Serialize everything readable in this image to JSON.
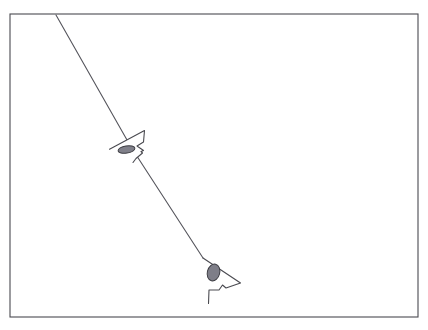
{
  "canvas": {
    "width": 428,
    "height": 330,
    "background_color": "#ffffff",
    "title": "Directional tracking diagram"
  },
  "frame": {
    "name": "border-rectangle",
    "x": 10,
    "y": 14,
    "width": 408,
    "height": 303,
    "stroke_color": "#4a4a50",
    "stroke_width": 1.1,
    "fill": "none"
  },
  "trajectory": {
    "name": "diagonal-path-line",
    "label": "trajectory line",
    "stroke_color": "#55555c",
    "stroke_width": 1.1,
    "points": [
      {
        "x": 56,
        "y": 15
      },
      {
        "x": 131,
        "y": 147
      },
      {
        "x": 203,
        "y": 258
      }
    ],
    "start_point": {
      "x": 56,
      "y": 15
    },
    "end_point": {
      "x": 203,
      "y": 258
    }
  },
  "markers": [
    {
      "id": "marker-upper",
      "name": "arrow-marker-upper",
      "label": "upper arrowhead marker",
      "orientation": "left-pointing",
      "stroke_color": "#4a4a50",
      "stroke_width": 1.1,
      "fill": "#ffffff",
      "outline_points": "109.5,149.2 144.5,130.5 143.5,142.0 137.0,146.0 143.5,150.5 141.0,151.5 142.5,153.0 136.0,158.5 133.0,162.5",
      "vertices": [
        {
          "x": 109.5,
          "y": 149.2
        },
        {
          "x": 144.5,
          "y": 130.5
        },
        {
          "x": 143.5,
          "y": 142.0
        },
        {
          "x": 137.0,
          "y": 146.0
        },
        {
          "x": 143.5,
          "y": 150.5
        },
        {
          "x": 141.0,
          "y": 151.5
        },
        {
          "x": 142.5,
          "y": 153.0
        },
        {
          "x": 136.0,
          "y": 158.5
        },
        {
          "x": 133.0,
          "y": 162.5
        }
      ],
      "ellipse": {
        "name": "marker-ellipse-upper",
        "cx": 126.5,
        "cy": 149.5,
        "rx": 8.5,
        "ry": 3.6,
        "rotation": -9,
        "fill_color": "#80808a",
        "stroke_color": "#3c3c42"
      }
    },
    {
      "id": "marker-lower",
      "name": "arrow-marker-lower",
      "label": "lower arrowhead marker",
      "orientation": "right-pointing",
      "stroke_color": "#4a4a50",
      "stroke_width": 1.1,
      "fill": "#ffffff",
      "outline_points": "203.0,258.0 240.5,283.0 226.0,288.0 222.5,285.0 219.0,290.0 209.0,290.0 208.5,303.5",
      "vertices": [
        {
          "x": 203.0,
          "y": 258.0
        },
        {
          "x": 240.5,
          "y": 283.0
        },
        {
          "x": 226.0,
          "y": 288.0
        },
        {
          "x": 222.5,
          "y": 285.0
        },
        {
          "x": 219.0,
          "y": 290.0
        },
        {
          "x": 209.0,
          "y": 290.0
        },
        {
          "x": 208.5,
          "y": 303.5
        }
      ],
      "ellipse": {
        "name": "marker-ellipse-lower",
        "cx": 213.5,
        "cy": 272.5,
        "rx": 6.2,
        "ry": 8.6,
        "rotation": 14,
        "fill_color": "#7e7e88",
        "stroke_color": "#3c3c42"
      }
    }
  ]
}
